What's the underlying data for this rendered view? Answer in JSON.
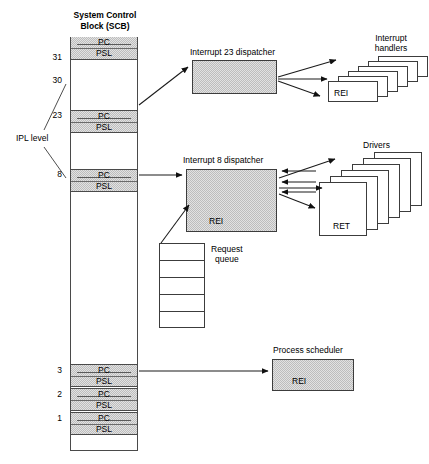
{
  "diagram": {
    "title_line1": "System Control",
    "title_line2": "Block (SCB)",
    "ipl_label": "IPL level"
  },
  "scb": {
    "vector_pc": "PC",
    "vector_psl": "PSL",
    "ipl_numbers": [
      "31",
      "30",
      "23",
      "8",
      "3",
      "2",
      "1"
    ],
    "vectors": [
      {
        "ipl": "31",
        "pc": "PC",
        "psl": "PSL"
      },
      {
        "ipl": "23",
        "pc": "PC",
        "psl": "PSL"
      },
      {
        "ipl": "8",
        "pc": "PC",
        "psl": "PSL"
      },
      {
        "ipl": "3",
        "pc": "PC",
        "psl": "PSL"
      },
      {
        "ipl": "2",
        "pc": "PC",
        "psl": "PSL"
      },
      {
        "ipl": "1",
        "pc": "PC",
        "psl": "PSL"
      }
    ]
  },
  "dispatcher23": {
    "label": "Interrupt 23 dispatcher"
  },
  "handlers": {
    "label_line1": "Interrupt",
    "label_line2": "handlers",
    "front_label": "REI",
    "count": 6
  },
  "dispatcher8": {
    "label": "Interrupt 8 dispatcher",
    "body_label": "REI"
  },
  "drivers": {
    "label": "Drivers",
    "front_label": "RET",
    "count": 6
  },
  "request_queue": {
    "label_line1": "Request",
    "label_line2": "queue",
    "cells": 5
  },
  "scheduler": {
    "label": "Process scheduler",
    "body_label": "REI"
  },
  "colors": {
    "fill_gray": "#dcdcdc",
    "stroke": "#3c3c3c",
    "background": "#ffffff"
  }
}
